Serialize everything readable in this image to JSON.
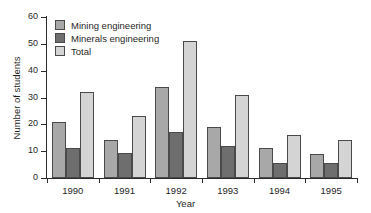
{
  "chart_data": {
    "type": "bar",
    "title": "",
    "subtitle": "",
    "xlabel": "Year",
    "ylabel": "Number of students",
    "categories": [
      "1990",
      "1991",
      "1992",
      "1993",
      "1994",
      "1995"
    ],
    "series": [
      {
        "name": "Mining engineering",
        "color": "#a8a8a8",
        "values": [
          21,
          14,
          34,
          19,
          11,
          9
        ]
      },
      {
        "name": "Minerals engineering",
        "color": "#6e6e6e",
        "values": [
          11,
          9.5,
          17,
          12,
          5.5,
          5.5
        ]
      },
      {
        "name": "Total",
        "color": "#d4d4d4",
        "values": [
          32,
          23,
          51,
          31,
          16,
          14
        ]
      }
    ],
    "ylim": [
      0,
      60
    ],
    "yticks": [
      0,
      10,
      20,
      30,
      40,
      50,
      60
    ],
    "ytick_labels": [
      "0",
      "10",
      "20",
      "30",
      "40",
      "50",
      "60"
    ],
    "xtick_labels": [
      "1990",
      "1991",
      "1992",
      "1993",
      "1994",
      "1995"
    ],
    "grid": false,
    "legend_position": "upper left",
    "bar_outline_color": "#4a4a4a",
    "axis_color": "#2b2b2b",
    "background": "#ffffff"
  }
}
